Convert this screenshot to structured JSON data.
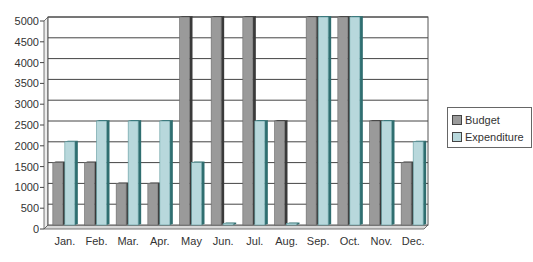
{
  "chart_data": {
    "type": "bar",
    "title": "",
    "xlabel": "",
    "ylabel": "",
    "ylim": [
      0,
      5000
    ],
    "yticks": [
      0,
      500,
      1000,
      1500,
      2000,
      2500,
      3000,
      3500,
      4000,
      4500,
      5000
    ],
    "grid": true,
    "legend_position": "right",
    "categories": [
      "Jan.",
      "Feb.",
      "Mar.",
      "Apr.",
      "May",
      "Jun.",
      "Jul.",
      "Aug.",
      "Sep.",
      "Oct.",
      "Nov.",
      "Dec."
    ],
    "series": [
      {
        "name": "Budget",
        "color": "#9a9a9a",
        "values": [
          1500,
          1500,
          1000,
          1000,
          5000,
          5000,
          5000,
          2500,
          5000,
          5000,
          2500,
          1500
        ]
      },
      {
        "name": "Expenditure",
        "color": "#b8d8dc",
        "values": [
          2000,
          2500,
          2500,
          2500,
          1500,
          0,
          2500,
          0,
          5000,
          5000,
          2500,
          2000
        ]
      }
    ]
  },
  "legend": {
    "items": [
      {
        "label": "Budget",
        "color": "#9a9a9a"
      },
      {
        "label": "Expenditure",
        "color": "#b8d8dc"
      }
    ]
  }
}
